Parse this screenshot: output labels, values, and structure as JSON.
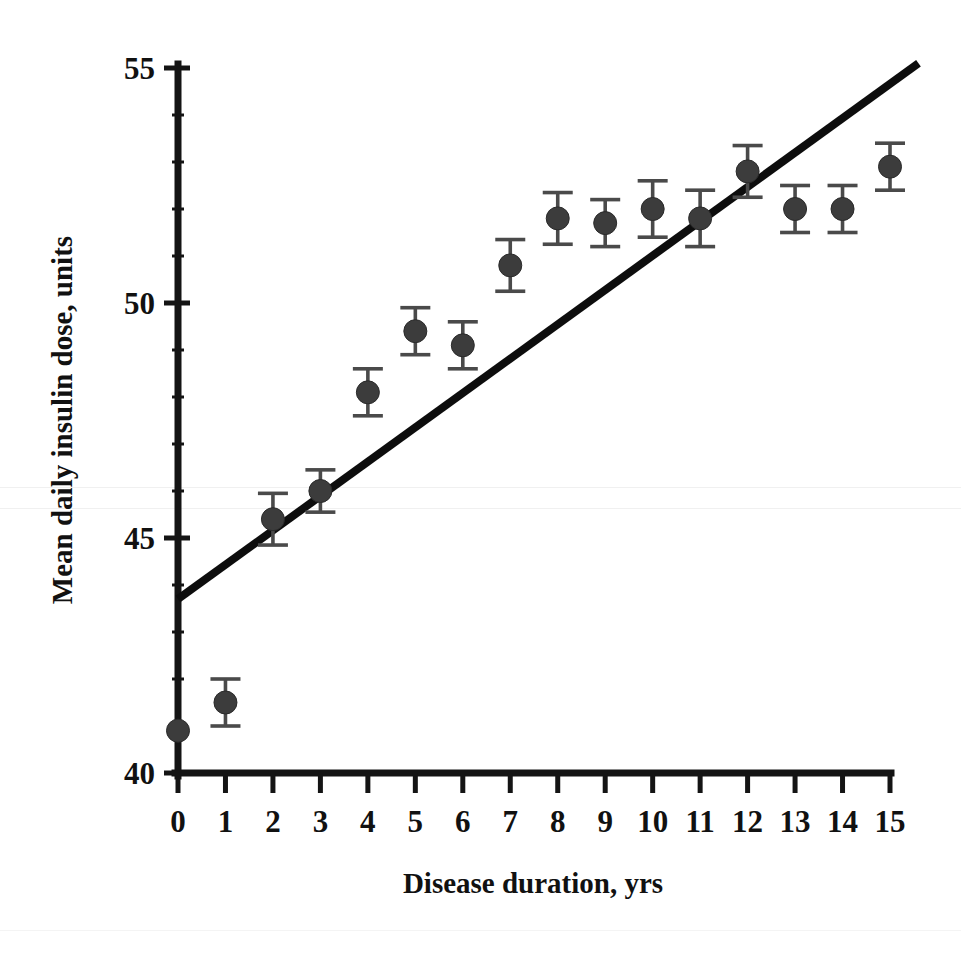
{
  "chart_data": {
    "type": "scatter",
    "title": "",
    "subtitle": "",
    "xlabel": "Disease duration, yrs",
    "ylabel": "Mean daily insulin dose, units",
    "xlim": [
      0,
      15
    ],
    "ylim": [
      40,
      55
    ],
    "xticks": [
      0,
      1,
      2,
      3,
      4,
      5,
      6,
      7,
      8,
      9,
      10,
      11,
      12,
      13,
      14,
      15
    ],
    "xtick_labels": [
      "0",
      "1",
      "2",
      "3",
      "4",
      "5",
      "6",
      "7",
      "8",
      "9",
      "10",
      "11",
      "12",
      "13",
      "14",
      "15"
    ],
    "yticks": [
      40,
      45,
      50,
      55
    ],
    "ytick_labels": [
      "40",
      "45",
      "50",
      "55"
    ],
    "y_minor_ticks": [
      41,
      42,
      43,
      44,
      46,
      47,
      48,
      49,
      51,
      52,
      53,
      54
    ],
    "grid": false,
    "legend": null,
    "x": [
      0,
      1,
      2,
      3,
      4,
      5,
      6,
      7,
      8,
      9,
      10,
      11,
      12,
      13,
      14,
      15
    ],
    "values": [
      40.9,
      41.5,
      45.4,
      46.0,
      48.1,
      49.4,
      49.1,
      50.8,
      51.8,
      51.7,
      52.0,
      51.8,
      52.8,
      52.0,
      52.0,
      52.9
    ],
    "errors": [
      0.0,
      0.5,
      0.55,
      0.45,
      0.5,
      0.5,
      0.5,
      0.55,
      0.55,
      0.5,
      0.6,
      0.6,
      0.55,
      0.5,
      0.5,
      0.5
    ],
    "series": [
      {
        "name": "Mean daily insulin dose",
        "marker": "filled-circle",
        "color": "#3c3c3c",
        "values": [
          40.9,
          41.5,
          45.4,
          46.0,
          48.1,
          49.4,
          49.1,
          50.8,
          51.8,
          51.7,
          52.0,
          51.8,
          52.8,
          52.0,
          52.0,
          52.9
        ]
      }
    ],
    "trendline": {
      "type": "linear",
      "color": "#0d0d0d",
      "x_start": 0,
      "y_start": 43.7,
      "x_end": 15.6,
      "y_end": 55.1
    },
    "colors": {
      "marker": "#3c3c3c",
      "errorbar": "#4a4a4a",
      "axis": "#141414",
      "trendline": "#0d0d0d",
      "background": "#ffffff",
      "text": "#111111"
    }
  },
  "axes": {
    "x_title": "Disease duration, yrs",
    "y_title": "Mean daily insulin dose, units"
  }
}
